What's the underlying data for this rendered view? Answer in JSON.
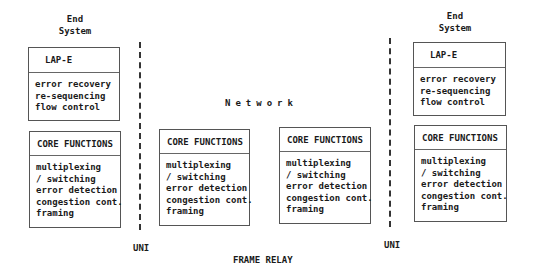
{
  "diagram": {
    "title": "FRAME RELAY",
    "network_label": "Network",
    "left_end_system": {
      "title_line1": "End",
      "title_line2": "System",
      "upper_box": {
        "header": "LAP-E",
        "items": [
          "error recovery",
          "re-sequencing",
          "flow control"
        ]
      },
      "core_box": {
        "header": "CORE FUNCTIONS",
        "items": [
          "multiplexing",
          "/ switching",
          "error detection",
          "congestion cont.",
          "framing"
        ]
      }
    },
    "network_nodes": [
      {
        "header": "CORE FUNCTIONS",
        "items": [
          "multiplexing",
          "/ switching",
          "error detection",
          "congestion cont.",
          "framing"
        ]
      },
      {
        "header": "CORE FUNCTIONS",
        "items": [
          "multiplexing",
          "/ switching",
          "error detection",
          "congestion cont.",
          "framing"
        ]
      }
    ],
    "right_end_system": {
      "title_line1": "End",
      "title_line2": "System",
      "upper_box": {
        "header": "LAP-E",
        "items": [
          "error recovery",
          "re-sequencing",
          "flow control"
        ]
      },
      "core_box": {
        "header": "CORE FUNCTIONS",
        "items": [
          "multiplexing",
          "/ switching",
          "error detection",
          "congestion cont.",
          "framing"
        ]
      }
    },
    "interfaces": {
      "left": "UNI",
      "right": "UNI"
    },
    "colors": {
      "line": "#333333",
      "text": "#1a1a1a",
      "background": "#ffffff"
    }
  }
}
